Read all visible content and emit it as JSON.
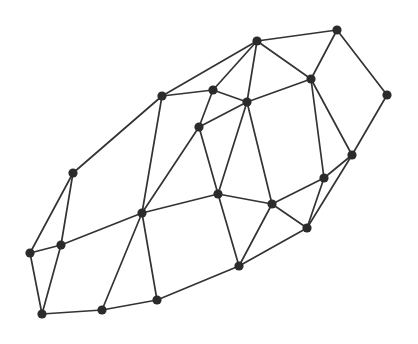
{
  "diagram": {
    "type": "undirected-graph",
    "width": 418,
    "height": 344,
    "colors": {
      "background": "#ffffff",
      "edge": "#333333",
      "node": "#2b2b2b"
    },
    "node_radius": 4.6,
    "nodes": [
      {
        "id": 0,
        "x": 257,
        "y": 41
      },
      {
        "id": 1,
        "x": 337,
        "y": 30
      },
      {
        "id": 2,
        "x": 311,
        "y": 79
      },
      {
        "id": 3,
        "x": 387,
        "y": 95
      },
      {
        "id": 4,
        "x": 162,
        "y": 96
      },
      {
        "id": 5,
        "x": 213,
        "y": 90
      },
      {
        "id": 6,
        "x": 247,
        "y": 102
      },
      {
        "id": 7,
        "x": 199,
        "y": 127
      },
      {
        "id": 8,
        "x": 352,
        "y": 155
      },
      {
        "id": 9,
        "x": 324,
        "y": 178
      },
      {
        "id": 10,
        "x": 73,
        "y": 173
      },
      {
        "id": 11,
        "x": 218,
        "y": 194
      },
      {
        "id": 12,
        "x": 272,
        "y": 204
      },
      {
        "id": 13,
        "x": 142,
        "y": 213
      },
      {
        "id": 14,
        "x": 307,
        "y": 228
      },
      {
        "id": 15,
        "x": 61,
        "y": 245
      },
      {
        "id": 16,
        "x": 30,
        "y": 253
      },
      {
        "id": 17,
        "x": 239,
        "y": 266
      },
      {
        "id": 18,
        "x": 157,
        "y": 300
      },
      {
        "id": 19,
        "x": 102,
        "y": 310
      },
      {
        "id": 20,
        "x": 42,
        "y": 314
      }
    ],
    "edges": [
      [
        0,
        1
      ],
      [
        0,
        2
      ],
      [
        0,
        4
      ],
      [
        0,
        5
      ],
      [
        0,
        6
      ],
      [
        1,
        2
      ],
      [
        1,
        3
      ],
      [
        2,
        6
      ],
      [
        2,
        8
      ],
      [
        2,
        9
      ],
      [
        3,
        8
      ],
      [
        4,
        5
      ],
      [
        4,
        10
      ],
      [
        4,
        13
      ],
      [
        5,
        6
      ],
      [
        5,
        7
      ],
      [
        6,
        7
      ],
      [
        6,
        11
      ],
      [
        6,
        12
      ],
      [
        7,
        11
      ],
      [
        7,
        13
      ],
      [
        8,
        9
      ],
      [
        8,
        14
      ],
      [
        9,
        12
      ],
      [
        9,
        14
      ],
      [
        10,
        15
      ],
      [
        10,
        16
      ],
      [
        11,
        12
      ],
      [
        11,
        13
      ],
      [
        11,
        17
      ],
      [
        12,
        14
      ],
      [
        12,
        17
      ],
      [
        13,
        15
      ],
      [
        13,
        18
      ],
      [
        13,
        19
      ],
      [
        14,
        17
      ],
      [
        15,
        16
      ],
      [
        15,
        20
      ],
      [
        16,
        20
      ],
      [
        17,
        18
      ],
      [
        18,
        19
      ],
      [
        19,
        20
      ]
    ]
  }
}
